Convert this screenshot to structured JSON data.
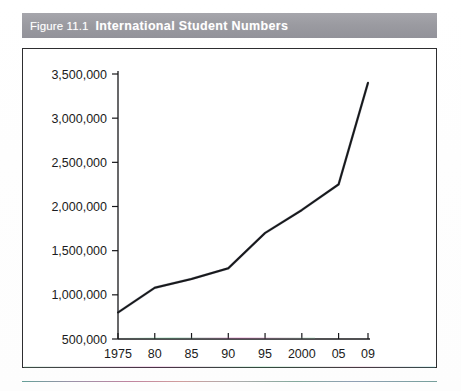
{
  "figure": {
    "number": "Figure 11.1",
    "caption": "International Student Numbers",
    "title_bar_color": "#9b9ba1",
    "title_text_color": "#ffffff"
  },
  "chart_data": {
    "type": "line",
    "title": "International Student Numbers",
    "xlabel": "",
    "ylabel": "",
    "categories": [
      "1975",
      "80",
      "85",
      "90",
      "95",
      "2000",
      "05",
      "09"
    ],
    "x": [
      1975,
      1980,
      1985,
      1990,
      1995,
      2000,
      2005,
      2009
    ],
    "values": [
      800000,
      1080000,
      1180000,
      1300000,
      1700000,
      1960000,
      2250000,
      3400000
    ],
    "series": [
      {
        "name": "International students",
        "values": [
          800000,
          1080000,
          1180000,
          1300000,
          1700000,
          1960000,
          2250000,
          3400000
        ]
      }
    ],
    "ytick_labels": [
      "500,000",
      "1,000,000",
      "1,500,000",
      "2,000,000",
      "2,500,000",
      "3,000,000",
      "3,500,000"
    ],
    "ytick_values": [
      500000,
      1000000,
      1500000,
      2000000,
      2500000,
      3000000,
      3500000
    ],
    "ylim": [
      500000,
      3500000
    ],
    "xlim": [
      1975,
      2009
    ],
    "grid": false,
    "legend": false,
    "line_color": "#18181c"
  }
}
